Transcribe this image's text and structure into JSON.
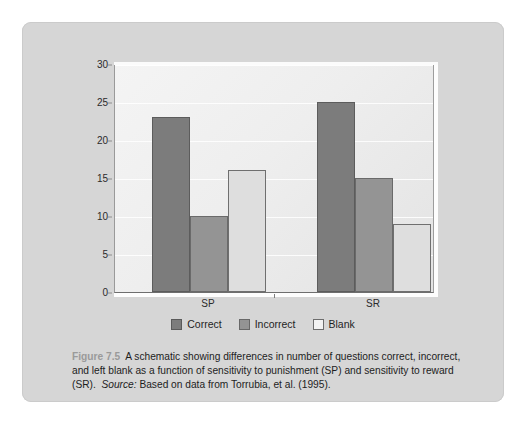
{
  "figure": {
    "number_label": "Figure 7.5",
    "caption_body": "A schematic showing differences in number of questions correct, incorrect, and left blank as a function of sensitivity to punishment (SP) and sensitivity to reward (SR).",
    "source_label": "Source:",
    "source_text": "Based on data from Torrubia, et al. (1995)."
  },
  "colors": {
    "panel_background": "#d6d6d6",
    "plot_background": "#eeeeee",
    "correct": "#7c7c7c",
    "incorrect": "#949494",
    "blank": "#dedede",
    "axis": "#6e6e6e",
    "text": "#1d1d1d",
    "figure_number": "#9a9a9a"
  },
  "chart_data": {
    "type": "bar",
    "title": "",
    "xlabel": "",
    "ylabel": "",
    "categories": [
      "SP",
      "SR"
    ],
    "series": [
      {
        "name": "Correct",
        "values": [
          23,
          25
        ]
      },
      {
        "name": "Incorrect",
        "values": [
          10,
          15
        ]
      },
      {
        "name": "Blank",
        "values": [
          16,
          9
        ]
      }
    ],
    "ylim": [
      0,
      30
    ],
    "yticks": [
      0,
      5,
      10,
      15,
      20,
      25,
      30
    ],
    "ytick_labels": [
      "0",
      "5",
      "10",
      "15",
      "20",
      "25",
      "30"
    ],
    "grid": true,
    "grid_axis": "y",
    "legend_position": "bottom"
  }
}
